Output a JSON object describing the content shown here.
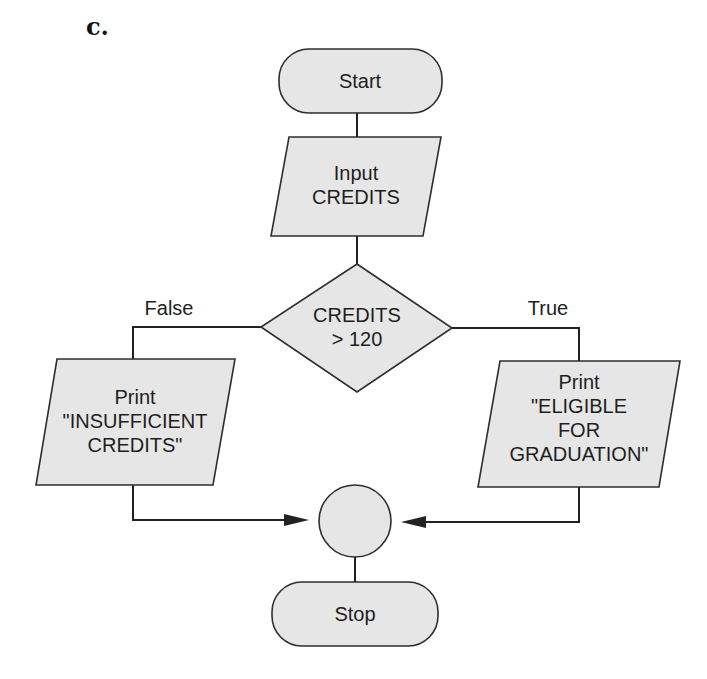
{
  "figure": {
    "part_label": "c."
  },
  "flowchart": {
    "start": {
      "label": "Start",
      "shape": "terminal"
    },
    "input": {
      "line1": "Input",
      "line2": "CREDITS",
      "shape": "parallelogram"
    },
    "decision": {
      "line1": "CREDITS",
      "line2": "> 120",
      "shape": "diamond"
    },
    "branches": {
      "false_label": "False",
      "true_label": "True"
    },
    "false_output": {
      "line1": "Print",
      "line2": "\"INSUFFICIENT",
      "line3": "CREDITS\"",
      "shape": "parallelogram"
    },
    "true_output": {
      "line1": "Print",
      "line2": "\"ELIGIBLE",
      "line3": "FOR",
      "line4": "GRADUATION\"",
      "shape": "parallelogram"
    },
    "connector": {
      "shape": "circle"
    },
    "stop": {
      "label": "Stop",
      "shape": "terminal"
    }
  },
  "colors": {
    "fill": "#e6e6e6",
    "stroke": "#2e2e2e",
    "text": "#1e1e1e",
    "background": "#ffffff"
  }
}
